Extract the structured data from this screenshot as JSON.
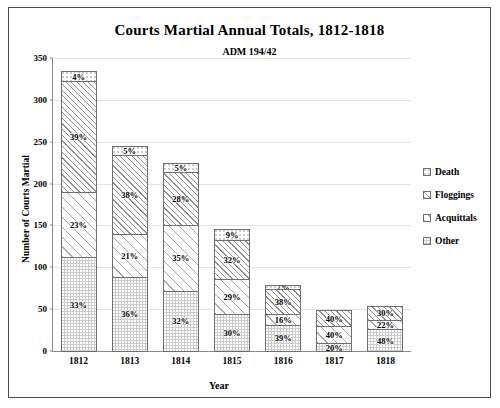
{
  "chart_data": {
    "type": "bar",
    "subtype": "stacked-bar",
    "title": "Courts Martial Annual Totals, 1812-1818",
    "subtitle": "ADM 194/42",
    "xlabel": "Year",
    "ylabel": "Number of Courts Martial",
    "ylim": [
      0,
      350
    ],
    "yticks": [
      0,
      50,
      100,
      150,
      200,
      250,
      300,
      350
    ],
    "ytick_labels": [
      "0",
      "50",
      "100",
      "150",
      "200",
      "250",
      "300",
      "350"
    ],
    "grid": true,
    "legend_position": "right",
    "stack_order_top_to_bottom": [
      "Death",
      "Floggings",
      "Acquittals",
      "Other"
    ],
    "categories": [
      "1812",
      "1813",
      "1814",
      "1815",
      "1816",
      "1817",
      "1818"
    ],
    "totals": [
      343,
      250,
      229,
      150,
      84,
      53,
      57
    ],
    "series": [
      {
        "name": "Death",
        "pattern": "dotted-white",
        "percent_labels": [
          "4%",
          "5%",
          "5%",
          "9%",
          "7%",
          "",
          ""
        ],
        "percents": [
          4,
          5,
          5,
          9,
          7,
          0,
          0
        ],
        "values": [
          13.7,
          12.5,
          11.5,
          13.5,
          5.9,
          0,
          0
        ]
      },
      {
        "name": "Floggings",
        "pattern": "dense-diagonal-hatch",
        "percent_labels": [
          "39%",
          "38%",
          "28%",
          "32%",
          "38%",
          "40%",
          "30%"
        ],
        "percents": [
          39,
          38,
          28,
          32,
          38,
          40,
          30
        ],
        "values": [
          133.8,
          95.0,
          64.1,
          48.0,
          31.9,
          21.2,
          17.1
        ]
      },
      {
        "name": "Acquittals",
        "pattern": "light-diagonal-hatch",
        "percent_labels": [
          "23%",
          "21%",
          "35%",
          "29%",
          "16%",
          "40%",
          "22%"
        ],
        "percents": [
          23,
          21,
          35,
          29,
          16,
          40,
          22
        ],
        "values": [
          78.9,
          52.5,
          80.2,
          43.5,
          13.4,
          21.2,
          12.5
        ]
      },
      {
        "name": "Other",
        "pattern": "gray-dotted",
        "percent_labels": [
          "33%",
          "36%",
          "32%",
          "30%",
          "39%",
          "20%",
          "48%"
        ],
        "percents": [
          33,
          36,
          32,
          30,
          39,
          20,
          48
        ],
        "values": [
          113.2,
          90.0,
          73.3,
          45.0,
          32.8,
          10.6,
          27.4
        ]
      }
    ]
  },
  "legend": {
    "items": [
      {
        "label": "Death"
      },
      {
        "label": "Floggings"
      },
      {
        "label": "Acquittals"
      },
      {
        "label": "Other"
      }
    ]
  }
}
